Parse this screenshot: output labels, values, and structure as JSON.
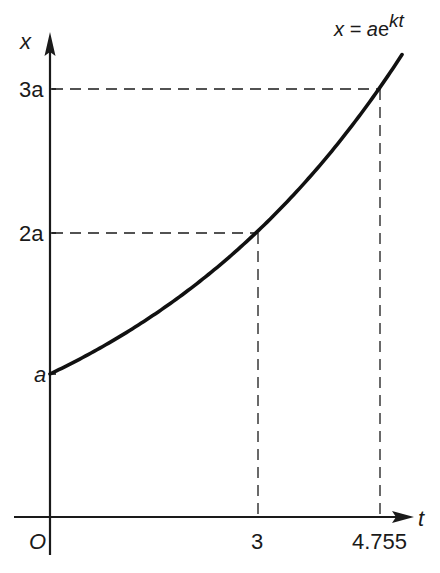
{
  "chart_data": {
    "type": "line",
    "title": "",
    "equation_label": "x = ae^{kt}",
    "equation_parts": {
      "lhs": "x = ",
      "coef": "a",
      "base": "e",
      "exponent": "kt"
    },
    "xlabel": "t",
    "ylabel": "x",
    "origin_label": "O",
    "x_ticks": [
      {
        "value": 3,
        "label": "3"
      },
      {
        "value": 4.755,
        "label": "4.755"
      }
    ],
    "y_ticks": [
      {
        "value": 1,
        "label": "a"
      },
      {
        "value": 2,
        "label": "2a"
      },
      {
        "value": 3,
        "label": "3a"
      }
    ],
    "series": [
      {
        "name": "x = ae^{kt}",
        "formula": "x = a * 2^(t/3)",
        "x": [
          0,
          0.5,
          1,
          1.5,
          2,
          2.5,
          3,
          3.5,
          4,
          4.5,
          4.755,
          5.08
        ],
        "y": [
          1,
          1.122,
          1.26,
          1.414,
          1.587,
          1.782,
          2,
          2.245,
          2.52,
          2.828,
          3,
          3.23
        ]
      }
    ],
    "marked_points": [
      {
        "t": 0,
        "x": 1,
        "label": "(0, a)"
      },
      {
        "t": 3,
        "x": 2,
        "label": "(3, 2a)"
      },
      {
        "t": 4.755,
        "x": 3,
        "label": "(4.755, 3a)"
      }
    ],
    "xlim": [
      0,
      5.3
    ],
    "ylim": [
      0,
      3.4
    ],
    "grid": false,
    "legend": "none",
    "guides": "dashed projection lines from marked points to both axes"
  },
  "labels": {
    "y_axis": "x",
    "x_axis": "t",
    "origin": "O",
    "tick_a": "a",
    "tick_2a": "2a",
    "tick_3a": "3a",
    "tick_3": "3",
    "tick_4755": "4.755",
    "eq_lhs": "x = ",
    "eq_coef": "a",
    "eq_base": "e",
    "eq_exp": "kt"
  }
}
